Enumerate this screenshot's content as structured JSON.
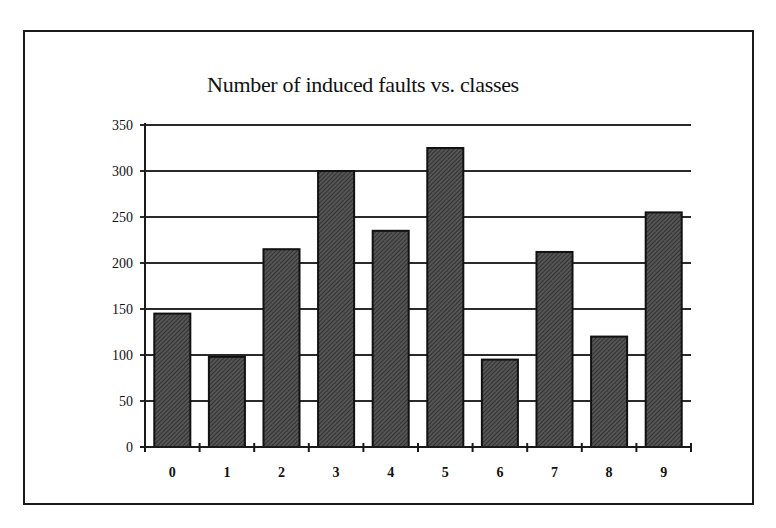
{
  "chart_data": {
    "type": "bar",
    "title": "Number of induced faults vs. classes",
    "xlabel": "",
    "ylabel": "",
    "categories": [
      "0",
      "1",
      "2",
      "3",
      "4",
      "5",
      "6",
      "7",
      "8",
      "9"
    ],
    "values": [
      145,
      98,
      215,
      300,
      235,
      325,
      95,
      212,
      120,
      255
    ],
    "ylim": [
      0,
      350
    ],
    "yticks": [
      0,
      50,
      100,
      150,
      200,
      250,
      300,
      350
    ],
    "grid": "horizontal",
    "legend": null,
    "bar_color": "#3a3a3a",
    "bar_edge_color": "#111111"
  }
}
